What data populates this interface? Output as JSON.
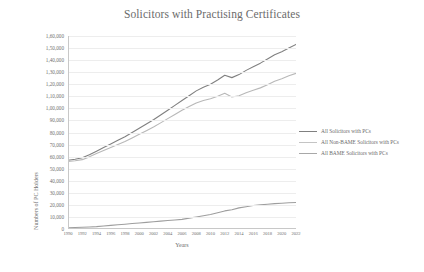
{
  "chart_data": {
    "type": "line",
    "title": "Solicitors with Practising Certificates",
    "xlabel": "Years",
    "ylabel": "Numbers of PC Holders",
    "grid": true,
    "legend_position": "right",
    "xlim": [
      1990,
      2022
    ],
    "ylim": [
      0,
      160000
    ],
    "ytick_labels": [
      "0",
      "10,000",
      "20,000",
      "30,000",
      "40,000",
      "50,000",
      "60,000",
      "70,000",
      "80,000",
      "90,000",
      "1,00,000",
      "1,10,000",
      "1,20,000",
      "1,30,000",
      "1,40,000",
      "1,50,000",
      "1,60,000"
    ],
    "ytick_values": [
      0,
      10000,
      20000,
      30000,
      40000,
      50000,
      60000,
      70000,
      80000,
      90000,
      100000,
      110000,
      120000,
      130000,
      140000,
      150000,
      160000
    ],
    "xtick_labels": [
      "1990",
      "1992",
      "1994",
      "1996",
      "1998",
      "2000",
      "2002",
      "2004",
      "2006",
      "2008",
      "2010",
      "2012",
      "2014",
      "2016",
      "2018",
      "2020",
      "2022"
    ],
    "x": [
      1990,
      1991,
      1992,
      1993,
      1994,
      1995,
      1996,
      1997,
      1998,
      1999,
      2000,
      2001,
      2002,
      2003,
      2004,
      2005,
      2006,
      2007,
      2008,
      2009,
      2010,
      2011,
      2012,
      2013,
      2014,
      2015,
      2016,
      2017,
      2018,
      2019,
      2020,
      2021,
      2022
    ],
    "series": [
      {
        "name": "All Solicitors with PCs",
        "color": "#808080",
        "values": [
          57000,
          57800,
          59000,
          61500,
          64500,
          67500,
          70500,
          73500,
          76500,
          80000,
          83500,
          87000,
          90500,
          94500,
          98500,
          102500,
          106500,
          110500,
          114500,
          117500,
          120000,
          123500,
          127500,
          125500,
          128000,
          131500,
          134500,
          137500,
          141000,
          144500,
          147000,
          150000,
          153000
        ]
      },
      {
        "name": "All Non-BAME Solicitors with PCs",
        "color": "#b8b8b8",
        "values": [
          56000,
          56600,
          57500,
          59800,
          62500,
          65000,
          67500,
          70000,
          72500,
          75500,
          78500,
          81500,
          84500,
          88000,
          91500,
          95000,
          98500,
          101500,
          104500,
          106500,
          108000,
          110000,
          112500,
          109500,
          110500,
          113000,
          115000,
          117000,
          119500,
          122500,
          124500,
          127000,
          129000
        ]
      },
      {
        "name": "All BAME Solicitors with PCs",
        "color": "#9e9e9e",
        "values": [
          1000,
          1200,
          1500,
          1700,
          2000,
          2500,
          3000,
          3500,
          4000,
          4500,
          5000,
          5500,
          6000,
          6500,
          7000,
          7500,
          8000,
          9000,
          10000,
          11000,
          12000,
          13500,
          15000,
          16000,
          17500,
          18500,
          19500,
          20000,
          20500,
          21000,
          21300,
          21700,
          22000
        ]
      }
    ]
  },
  "legend": {
    "items": [
      {
        "label": "All Solicitors with PCs",
        "color": "#808080"
      },
      {
        "label": "All Non-BAME Solicitors with PCs",
        "color": "#c4c4c4"
      },
      {
        "label": "All BAME Solicitors with PCs",
        "color": "#a8a8a8"
      }
    ]
  }
}
